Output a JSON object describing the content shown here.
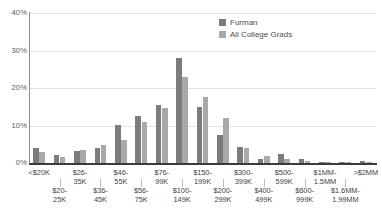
{
  "chart_data": {
    "type": "bar",
    "title": "",
    "subtitle": "",
    "xlabel": "",
    "ylabel": "",
    "ylim": [
      0,
      40
    ],
    "yticks": [
      0,
      10,
      20,
      30,
      40
    ],
    "ytick_labels": [
      "0%",
      "10%",
      "20%",
      "30%",
      "40%"
    ],
    "grid": true,
    "legend_position": "top-right",
    "categories": [
      "<$20K",
      "$20-25K",
      "$26-35K",
      "$36-45K",
      "$46-55K",
      "$56-75K",
      "$76-99K",
      "$100-149K",
      "$150-199K",
      "$200-299K",
      "$300-399K",
      "$400-499K",
      "$500-599K",
      "$600-999K",
      "$1MM-1.5MM",
      "$1.6MM-1.99MM",
      ">$2MM"
    ],
    "category_lines": [
      [
        "<$20K"
      ],
      [
        "$20-",
        "25K"
      ],
      [
        "$26-",
        "35K"
      ],
      [
        "$36-",
        "45K"
      ],
      [
        "$46-",
        "55K"
      ],
      [
        "$56-",
        "75K"
      ],
      [
        "$76-",
        "99K"
      ],
      [
        "$100-",
        "149K"
      ],
      [
        "$150-",
        "199K"
      ],
      [
        "$200-",
        "299K"
      ],
      [
        "$300-",
        "399K"
      ],
      [
        "$400-",
        "499K"
      ],
      [
        "$500-",
        "599K"
      ],
      [
        "$600-",
        "999K"
      ],
      [
        "$1MM-",
        "1.5MM"
      ],
      [
        "$1.6MM-",
        "1.99MM"
      ],
      [
        ">$2MM"
      ]
    ],
    "series": [
      {
        "name": "Furman",
        "color": "#7c7c7c",
        "values": [
          4.0,
          2.2,
          3.3,
          4.1,
          10.2,
          12.5,
          15.6,
          28.0,
          15.0,
          7.6,
          4.4,
          1.0,
          2.3,
          1.0,
          0.4,
          0.3,
          0.6
        ]
      },
      {
        "name": "All College Grads",
        "color": "#a9a9a9",
        "values": [
          3.0,
          1.7,
          3.6,
          4.8,
          6.2,
          11.0,
          14.6,
          23.0,
          17.5,
          12.0,
          3.9,
          1.9,
          1.1,
          0.5,
          0.3,
          0.2,
          0.4
        ]
      }
    ]
  },
  "legend": {
    "items": [
      {
        "label": "Furman",
        "color": "#7c7c7c"
      },
      {
        "label": "All College Grads",
        "color": "#a9a9a9"
      }
    ]
  }
}
